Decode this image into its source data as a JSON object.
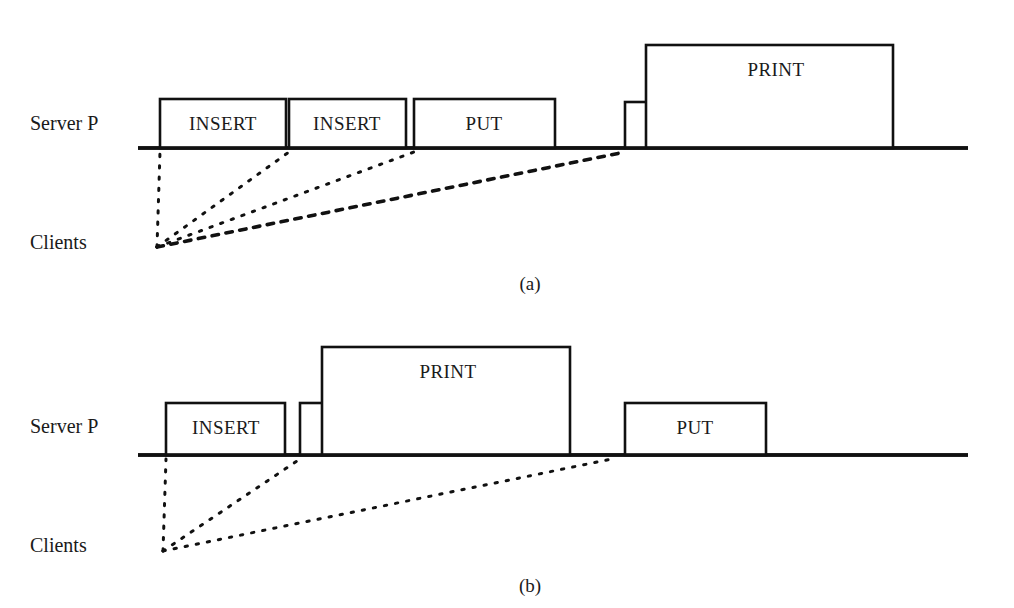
{
  "figure": {
    "title": "",
    "background_color": "#ffffff",
    "line_color": "#111111",
    "box_fill": "#ffffff",
    "width": 1014,
    "height": 608
  },
  "panels": [
    {
      "id": "panel-a",
      "caption": "(a)",
      "caption_x": 530,
      "caption_y": 290,
      "server_label": "Server P",
      "server_label_x": 30,
      "server_label_y": 130,
      "clients_label": "Clients",
      "clients_label_x": 30,
      "clients_label_y": 249,
      "timeline": {
        "x1": 138,
        "x2": 968,
        "y": 148
      },
      "boxes": [
        {
          "label": "INSERT",
          "x": 160,
          "width": 126,
          "top": 99,
          "label_x": 223,
          "label_y": 130
        },
        {
          "label": "INSERT",
          "x": 289,
          "width": 117,
          "top": 99,
          "label_x": 347,
          "label_y": 130
        },
        {
          "label": "PUT",
          "x": 414,
          "width": 141,
          "top": 99,
          "label_x": 484,
          "label_y": 130
        },
        {
          "label": "GET",
          "x": 625,
          "width": 119,
          "top": 102,
          "label_x": 692,
          "label_y": 132
        },
        {
          "label": "PRINT",
          "x": 646,
          "width": 247,
          "top": 45,
          "label_x": 776,
          "label_y": 76
        }
      ],
      "client_origin": {
        "x": 157,
        "y": 247
      },
      "messages": [
        {
          "to_x": 160,
          "to_y": 152,
          "style": "dotted",
          "dot_size": 2.3,
          "gap": 9
        },
        {
          "to_x": 289,
          "to_y": 152,
          "style": "dotted",
          "dot_size": 2.3,
          "gap": 9
        },
        {
          "to_x": 414,
          "to_y": 152,
          "style": "dotted",
          "dot_size": 2.3,
          "gap": 9
        },
        {
          "to_x": 625,
          "to_y": 152,
          "style": "dashed",
          "dot_size": 3.4,
          "gap": 11
        }
      ]
    },
    {
      "id": "panel-b",
      "caption": "(b)",
      "caption_x": 530,
      "caption_y": 592,
      "server_label": "Server P",
      "server_label_x": 30,
      "server_label_y": 433,
      "clients_label": "Clients",
      "clients_label_x": 30,
      "clients_label_y": 552,
      "timeline": {
        "x1": 138,
        "x2": 968,
        "y": 455
      },
      "boxes": [
        {
          "label": "INSERT",
          "x": 166,
          "width": 119,
          "top": 403,
          "label_x": 226,
          "label_y": 434
        },
        {
          "label": "GET",
          "x": 300,
          "width": 120,
          "top": 403,
          "label_x": 363,
          "label_y": 434
        },
        {
          "label": "PRINT",
          "x": 322,
          "width": 248,
          "top": 347,
          "label_x": 448,
          "label_y": 378
        },
        {
          "label": "PUT",
          "x": 625,
          "width": 141,
          "top": 403,
          "label_x": 695,
          "label_y": 434
        }
      ],
      "client_origin": {
        "x": 163,
        "y": 551
      },
      "messages": [
        {
          "to_x": 166,
          "to_y": 459,
          "style": "dotted",
          "dot_size": 2.3,
          "gap": 9
        },
        {
          "to_x": 300,
          "to_y": 459,
          "style": "dotted",
          "dot_size": 2.3,
          "gap": 9
        },
        {
          "to_x": 612,
          "to_y": 459,
          "style": "dotted",
          "dot_size": 2.3,
          "gap": 9
        }
      ]
    }
  ]
}
